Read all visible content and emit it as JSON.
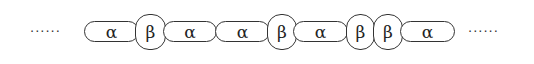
{
  "diagram": {
    "left_ellipsis": "······",
    "right_ellipsis": "······",
    "segments": [
      {
        "type": "alpha",
        "label": "α"
      },
      {
        "type": "beta",
        "label": "β"
      },
      {
        "type": "alpha",
        "label": "α"
      },
      {
        "type": "alpha",
        "label": "α"
      },
      {
        "type": "beta",
        "label": "β"
      },
      {
        "type": "alpha",
        "label": "α"
      },
      {
        "type": "beta",
        "label": "β"
      },
      {
        "type": "beta",
        "label": "β"
      },
      {
        "type": "alpha",
        "label": "α"
      }
    ]
  }
}
